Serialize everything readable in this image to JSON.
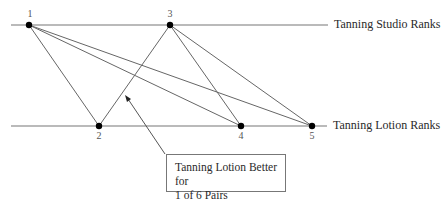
{
  "labels": {
    "top_axis": "Tanning Studio Ranks",
    "bottom_axis": "Tanning Lotion Ranks"
  },
  "top_ranks": [
    "1",
    "3"
  ],
  "bottom_ranks": [
    "2",
    "4",
    "5"
  ],
  "callout": {
    "line1": "Tanning Lotion Better for",
    "line2": "1 of 6 Pairs"
  },
  "connections": [
    {
      "from": "1",
      "to": "2"
    },
    {
      "from": "1",
      "to": "4"
    },
    {
      "from": "1",
      "to": "5"
    },
    {
      "from": "3",
      "to": "2"
    },
    {
      "from": "3",
      "to": "4"
    },
    {
      "from": "3",
      "to": "5"
    }
  ],
  "colors": {
    "line": "#666666",
    "dot": "#000000",
    "text": "#2a2a2a"
  }
}
